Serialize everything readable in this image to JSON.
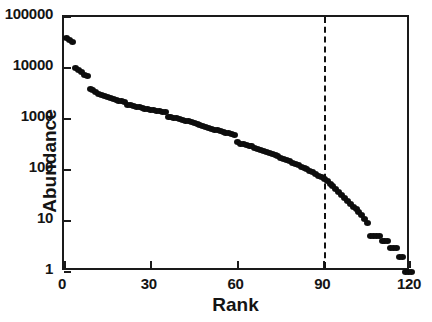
{
  "chart_data": {
    "type": "scatter",
    "title": "",
    "xlabel": "Rank",
    "ylabel": "Abundance",
    "xlim": [
      0,
      120
    ],
    "ylim": [
      1,
      100000
    ],
    "yscale": "log",
    "grid": false,
    "legend": "none",
    "xticks": [
      0,
      30,
      60,
      90,
      120
    ],
    "xticklabels": [
      "0",
      "30",
      "60",
      "90",
      "120"
    ],
    "yticks": [
      1,
      10,
      100,
      1000,
      10000,
      100000
    ],
    "yticklabels": [
      "1",
      "10",
      "100",
      "1000",
      "10000",
      "100000"
    ],
    "marker": "filled-circle",
    "marker_color": "#0d0d0d",
    "annotations": [
      {
        "type": "vertical-dashed-line",
        "x": 90,
        "label": "rank-90-reference-line",
        "color": "#111111",
        "style": "dashed"
      }
    ],
    "x": [
      1,
      2,
      3,
      4,
      5,
      6,
      7,
      8,
      9,
      10,
      11,
      12,
      13,
      14,
      15,
      16,
      17,
      18,
      19,
      20,
      21,
      22,
      23,
      24,
      25,
      26,
      27,
      28,
      29,
      30,
      31,
      32,
      33,
      34,
      35,
      36,
      37,
      38,
      39,
      40,
      41,
      42,
      43,
      44,
      45,
      46,
      47,
      48,
      49,
      50,
      51,
      52,
      53,
      54,
      55,
      56,
      57,
      58,
      59,
      60,
      61,
      62,
      63,
      64,
      65,
      66,
      67,
      68,
      69,
      70,
      71,
      72,
      73,
      74,
      75,
      76,
      77,
      78,
      79,
      80,
      81,
      82,
      83,
      84,
      85,
      86,
      87,
      88,
      89,
      90,
      91,
      92,
      93,
      94,
      95,
      96,
      97,
      98,
      99,
      100,
      101,
      102,
      103,
      104,
      105,
      106,
      107,
      108,
      109,
      110,
      111,
      112,
      113,
      114,
      115,
      116,
      117,
      118,
      119,
      120
    ],
    "values": [
      38000,
      35000,
      33000,
      9800,
      9000,
      8200,
      7300,
      6900,
      3900,
      3700,
      3400,
      3100,
      2900,
      2800,
      2700,
      2600,
      2500,
      2400,
      2300,
      2250,
      2200,
      1900,
      1850,
      1800,
      1750,
      1700,
      1650,
      1600,
      1560,
      1520,
      1480,
      1450,
      1420,
      1400,
      1380,
      1100,
      1080,
      1050,
      1030,
      1000,
      960,
      930,
      900,
      870,
      840,
      800,
      770,
      740,
      710,
      680,
      650,
      620,
      600,
      580,
      560,
      540,
      520,
      500,
      480,
      350,
      330,
      320,
      310,
      300,
      290,
      275,
      260,
      250,
      240,
      230,
      215,
      205,
      195,
      185,
      175,
      165,
      155,
      148,
      140,
      132,
      124,
      116,
      110,
      103,
      97,
      90,
      84,
      78,
      72,
      66,
      60,
      54,
      48,
      42,
      37,
      32,
      28,
      25,
      22,
      19,
      17,
      15,
      13,
      11,
      9,
      5,
      5,
      5,
      5,
      4,
      4,
      4,
      3,
      3,
      3,
      2,
      2,
      1,
      1,
      1
    ]
  },
  "axes": {
    "y_title": "Abundance",
    "x_title": "Rank"
  }
}
